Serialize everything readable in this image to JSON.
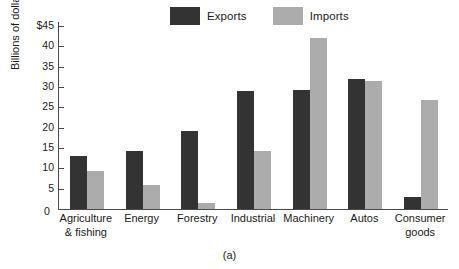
{
  "chart_data": {
    "type": "bar",
    "title": "",
    "subtitle": "",
    "caption": "(a)",
    "xlabel": "",
    "ylabel": "Billions of dollars",
    "categories": [
      "Agriculture\n& fishing",
      "Energy",
      "Forestry",
      "Industrial",
      "Machinery",
      "Autos",
      "Consumer\ngoods"
    ],
    "series": [
      {
        "name": "Exports",
        "color": "#333333",
        "values": [
          13,
          14.3,
          19.3,
          29,
          29.3,
          32,
          3
        ]
      },
      {
        "name": "Imports",
        "color": "#acacac",
        "values": [
          9.3,
          6,
          1.5,
          14.3,
          42,
          31.5,
          26.8
        ]
      }
    ],
    "ylim": [
      0,
      46
    ],
    "yticks": [
      0,
      5,
      10,
      15,
      20,
      25,
      30,
      35,
      40,
      45
    ],
    "ytick_labels": [
      "0",
      "5",
      "10",
      "15",
      "20",
      "25",
      "30",
      "35",
      "40",
      "$45"
    ],
    "grid": false,
    "legend_position": "top-center"
  },
  "legend": {
    "entries": [
      {
        "label": "Exports",
        "swatch_name": "exports-swatch"
      },
      {
        "label": "Imports",
        "swatch_name": "imports-swatch"
      }
    ]
  },
  "axes": {
    "y_title": "Billions of dollars",
    "origin_label": "0"
  },
  "caption": {
    "text": "(a)"
  }
}
